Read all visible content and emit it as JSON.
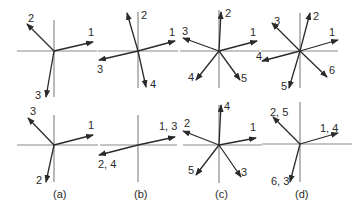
{
  "figure": {
    "colors": {
      "axis": "#8a8a8a",
      "vector": "#2a2a2a",
      "background": "#ffffff"
    },
    "panels": [
      {
        "id": "a",
        "caption": "(a)",
        "caption_pos": [
          53,
          198
        ],
        "top": {
          "center": [
            54,
            51
          ],
          "h_axis": [
            17,
            97
          ],
          "v_axis": [
            20,
            97
          ],
          "vectors": [
            {
              "label": "1",
              "tip": [
                93,
                42
              ],
              "label_pos": [
                88,
                36
              ]
            },
            {
              "label": "2",
              "tip": [
                27,
                24
              ],
              "label_pos": [
                28,
                22
              ]
            },
            {
              "label": "3",
              "tip": [
                46,
                97
              ],
              "label_pos": [
                35,
                99
              ]
            }
          ]
        },
        "bottom": {
          "center": [
            54,
            145
          ],
          "h_axis": [
            17,
            98
          ],
          "v_axis": [
            115,
            182
          ],
          "vectors": [
            {
              "label": "1",
              "tip": [
                93,
                135
              ],
              "label_pos": [
                88,
                129
              ]
            },
            {
              "label": "3",
              "tip": [
                28,
                118
              ],
              "label_pos": [
                30,
                115
              ]
            },
            {
              "label": "2",
              "tip": [
                46,
                182
              ],
              "label_pos": [
                36,
                184
              ]
            }
          ]
        }
      },
      {
        "id": "b",
        "caption": "(b)",
        "caption_pos": [
          134,
          198
        ],
        "top": {
          "center": [
            138,
            51
          ],
          "h_axis": [
            98,
            178
          ],
          "v_axis": [
            12,
            88
          ],
          "vectors": [
            {
              "label": "1",
              "tip": [
                175,
                41
              ],
              "label_pos": [
                169,
                36
              ]
            },
            {
              "label": "2",
              "tip": [
                127,
                13
              ],
              "label_pos": [
                141,
                19
              ]
            },
            {
              "label": "3",
              "tip": [
                99,
                60
              ],
              "label_pos": [
                97,
                73
              ]
            },
            {
              "label": "4",
              "tip": [
                146,
                87
              ],
              "label_pos": [
                150,
                88
              ]
            }
          ]
        },
        "bottom": {
          "center": [
            138,
            145
          ],
          "h_axis": [
            100,
            177
          ],
          "v_axis": [
            115,
            182
          ],
          "vectors": [
            {
              "label": "1, 3",
              "tip": [
                175,
                137
              ],
              "label_pos": [
                159,
                130
              ]
            },
            {
              "label": "2, 4",
              "tip": [
                99,
                155
              ],
              "label_pos": [
                98,
                168
              ]
            }
          ]
        }
      },
      {
        "id": "c",
        "caption": "(c)",
        "caption_pos": [
          215,
          198
        ],
        "top": {
          "center": [
            219,
            51
          ],
          "h_axis": [
            180,
            260
          ],
          "v_axis": [
            10,
            88
          ],
          "vectors": [
            {
              "label": "1",
              "tip": [
                257,
                41
              ],
              "label_pos": [
                250,
                36
              ]
            },
            {
              "label": "2",
              "tip": [
                221,
                12
              ],
              "label_pos": [
                225,
                17
              ]
            },
            {
              "label": "3",
              "tip": [
                183,
                38
              ],
              "label_pos": [
                182,
                35
              ]
            },
            {
              "label": "4",
              "tip": [
                196,
                80
              ],
              "label_pos": [
                188,
                81
              ]
            },
            {
              "label": "5",
              "tip": [
                240,
                80
              ],
              "label_pos": [
                241,
                82
              ]
            }
          ]
        },
        "bottom": {
          "center": [
            219,
            145
          ],
          "h_axis": [
            183,
            262
          ],
          "v_axis": [
            105,
            183
          ],
          "vectors": [
            {
              "label": "1",
              "tip": [
                256,
                138
              ],
              "label_pos": [
                250,
                131
              ]
            },
            {
              "label": "2",
              "tip": [
                183,
                131
              ],
              "label_pos": [
                184,
                127
              ]
            },
            {
              "label": "3",
              "tip": [
                241,
                177
              ],
              "label_pos": [
                241,
                176
              ]
            },
            {
              "label": "4",
              "tip": [
                221,
                105
              ],
              "label_pos": [
                224,
                110
              ]
            },
            {
              "label": "5",
              "tip": [
                196,
                175
              ],
              "label_pos": [
                188,
                174
              ]
            }
          ]
        }
      },
      {
        "id": "d",
        "caption": "(d)",
        "caption_pos": [
          295,
          198
        ],
        "top": {
          "center": [
            300,
            51
          ],
          "h_axis": [
            261,
            338
          ],
          "v_axis": [
            13,
            88
          ],
          "vectors": [
            {
              "label": "1",
              "tip": [
                338,
                40
              ],
              "label_pos": [
                329,
                36
              ]
            },
            {
              "label": "2",
              "tip": [
                310,
                13
              ],
              "label_pos": [
                313,
                20
              ]
            },
            {
              "label": "3",
              "tip": [
                272,
                23
              ],
              "label_pos": [
                274,
                25
              ]
            },
            {
              "label": "4",
              "tip": [
                262,
                61
              ],
              "label_pos": [
                256,
                60
              ]
            },
            {
              "label": "5",
              "tip": [
                289,
                88
              ],
              "label_pos": [
                281,
                90
              ]
            },
            {
              "label": "6",
              "tip": [
                327,
                77
              ],
              "label_pos": [
                329,
                74
              ]
            }
          ]
        },
        "bottom": {
          "center": [
            300,
            144
          ],
          "h_axis": [
            262,
            352
          ],
          "v_axis": [
            102,
            182
          ],
          "vectors": [
            {
              "label": "1, 4",
              "tip": [
                338,
                133
              ],
              "label_pos": [
                320,
                132
              ]
            },
            {
              "label": "2, 5",
              "tip": [
                273,
                117
              ],
              "label_pos": [
                270,
                116
              ]
            },
            {
              "label": "6, 3",
              "tip": [
                290,
                182
              ],
              "label_pos": [
                271,
                185
              ]
            }
          ]
        }
      }
    ]
  }
}
